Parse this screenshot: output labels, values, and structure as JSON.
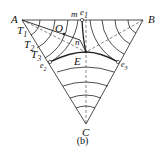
{
  "diagram": {
    "type": "ternary phase diagram",
    "vertices": {
      "A": "A",
      "B": "B",
      "C": "C"
    },
    "points": {
      "e1": "e",
      "e1_sub": "1",
      "e2": "e",
      "e2_sub": "2",
      "e3": "e",
      "e3_sub": "3",
      "E": "E",
      "O": "O",
      "m": "m",
      "n": "n"
    },
    "isotherms": {
      "T1": "T",
      "T1_sub": "1",
      "T2": "T",
      "T2_sub": "2",
      "T3": "T",
      "T3_sub": "3"
    },
    "caption": "(b)"
  }
}
